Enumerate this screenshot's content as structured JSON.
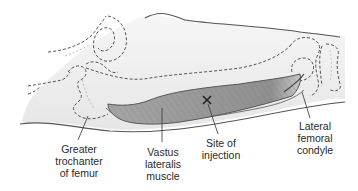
{
  "diagram": {
    "colors": {
      "outline": "#555555",
      "dashed_bone": "#555555",
      "muscle_fill": "#9a9a9a",
      "muscle_hatch": "#7a7a7a",
      "skin_shade": "#ececec",
      "label_text": "#2a2a2a",
      "marker": "#222222"
    },
    "marker": {
      "symbol": "X",
      "meaning": "injection site"
    },
    "labels": {
      "greater_trochanter": {
        "line1": "Greater",
        "line2": "trochanter",
        "line3": "of femur"
      },
      "vastus_lateralis": {
        "line1": "Vastus",
        "line2": "lateralis",
        "line3": "muscle"
      },
      "site_of_injection": {
        "line1": "Site of",
        "line2": "injection"
      },
      "lateral_femoral_condyle": {
        "line1": "Lateral",
        "line2": "femoral",
        "line3": "condyle"
      }
    }
  }
}
